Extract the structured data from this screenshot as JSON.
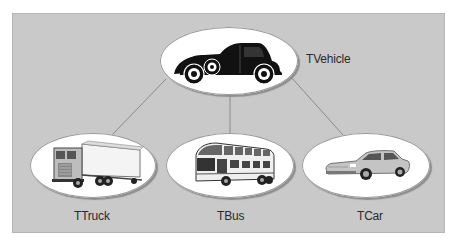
{
  "diagram": {
    "type": "class-hierarchy",
    "root": {
      "id": "vehicle",
      "label": "TVehicle",
      "icon": "vintage-car-icon"
    },
    "children": [
      {
        "id": "truck",
        "label": "TTruck",
        "icon": "truck-icon"
      },
      {
        "id": "bus",
        "label": "TBus",
        "icon": "bus-icon"
      },
      {
        "id": "car",
        "label": "TCar",
        "icon": "car-icon"
      }
    ],
    "edges": [
      {
        "from": "vehicle",
        "to": "truck"
      },
      {
        "from": "vehicle",
        "to": "bus"
      },
      {
        "from": "vehicle",
        "to": "car"
      }
    ],
    "colors": {
      "panel": "#c9c9c9",
      "node_fill": "#ffffff",
      "edge": "#8a8a8a",
      "text": "#2a2a2a"
    }
  }
}
